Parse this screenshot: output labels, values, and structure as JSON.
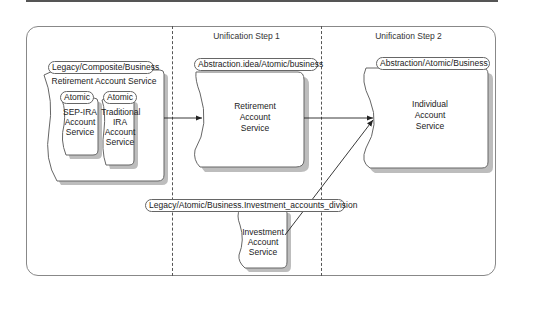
{
  "diagram": {
    "columns": [
      {
        "title": ""
      },
      {
        "title": "Unification Step 1"
      },
      {
        "title": "Unification Step 2"
      }
    ],
    "legacy_composite": {
      "stereotype": "Legacy/Composite/Business",
      "name": "Retirement Account Service",
      "children": [
        {
          "stereotype": "Atomic",
          "name_lines": [
            "SEP-IRA",
            "Account",
            "Service"
          ]
        },
        {
          "stereotype": "Atomic",
          "name_lines": [
            "Traditional",
            "IRA",
            "Account",
            "Service"
          ]
        }
      ]
    },
    "step1_service": {
      "stereotype": "Abstraction.idea/Atomic/business",
      "name_lines": [
        "Retirement",
        "Account",
        "Service"
      ]
    },
    "investment_service": {
      "stereotype": "Legacy/Atomic/Business.Investment_accounts_division",
      "name_lines": [
        "Investment",
        "Account",
        "Service"
      ]
    },
    "step2_service": {
      "stereotype": "Abstraction/Atomic/Business",
      "name_lines": [
        "Individual",
        "Account",
        "Service"
      ]
    },
    "connections": [
      {
        "from": "Legacy Retirement Account Service",
        "to": "Step1 Retirement Account Service",
        "type": "arrow"
      },
      {
        "from": "Step1 Retirement Account Service",
        "to": "Individual Account Service",
        "type": "arrow"
      },
      {
        "from": "Investment Account Service",
        "to": "Individual Account Service",
        "type": "arrow"
      }
    ]
  }
}
